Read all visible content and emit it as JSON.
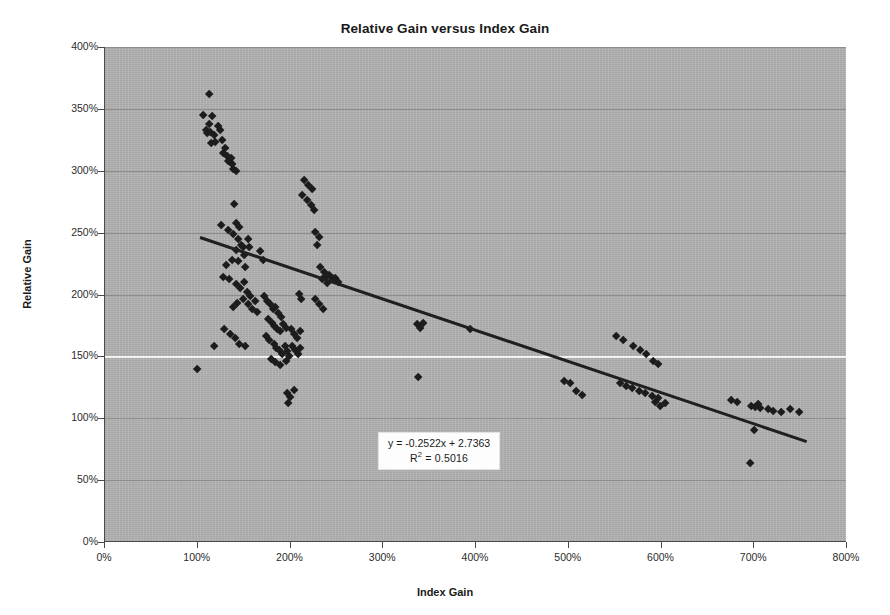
{
  "chart_data": {
    "type": "scatter",
    "title": "Relative Gain versus Index Gain",
    "xlabel": "Index Gain",
    "ylabel": "Relative Gain",
    "xlim": [
      0,
      800
    ],
    "ylim": [
      0,
      400
    ],
    "xtick_labels": [
      "0%",
      "100%",
      "200%",
      "300%",
      "400%",
      "500%",
      "600%",
      "700%",
      "800%"
    ],
    "xticks": [
      0,
      100,
      200,
      300,
      400,
      500,
      600,
      700,
      800
    ],
    "ytick_labels": [
      "0%",
      "50%",
      "100%",
      "150%",
      "200%",
      "250%",
      "300%",
      "350%",
      "400%"
    ],
    "yticks": [
      0,
      50,
      100,
      150,
      200,
      250,
      300,
      350,
      400
    ],
    "grid": "horizontal",
    "grid_highlight_value": 150,
    "legend": "none",
    "plot_background": "#b2b2b2",
    "marker": "diamond",
    "marker_color": "#1c1c1c",
    "trendline": {
      "type": "linear",
      "slope": -0.2522,
      "intercept": 2.7363,
      "r_squared": 0.5016,
      "equation_label": "y = -0.2522x + 2.7363",
      "r2_label_prefix": "R",
      "r2_label_sup": "2",
      "r2_label_suffix": " = 0.5016",
      "color": "#1f1f1f",
      "x_start": 103,
      "x_end": 757
    },
    "points": [
      [
        113,
        362
      ],
      [
        107,
        345
      ],
      [
        117,
        344
      ],
      [
        113,
        338
      ],
      [
        110,
        333
      ],
      [
        111,
        330
      ],
      [
        115,
        331
      ],
      [
        119,
        329
      ],
      [
        123,
        336
      ],
      [
        125,
        333
      ],
      [
        120,
        323
      ],
      [
        116,
        322
      ],
      [
        127,
        325
      ],
      [
        131,
        318
      ],
      [
        129,
        314
      ],
      [
        133,
        312
      ],
      [
        134,
        308
      ],
      [
        136,
        307
      ],
      [
        138,
        305
      ],
      [
        137,
        310
      ],
      [
        139,
        301
      ],
      [
        142,
        300
      ],
      [
        140,
        273
      ],
      [
        126,
        256
      ],
      [
        134,
        252
      ],
      [
        139,
        249
      ],
      [
        142,
        258
      ],
      [
        145,
        245
      ],
      [
        146,
        254
      ],
      [
        148,
        240
      ],
      [
        150,
        238
      ],
      [
        143,
        236
      ],
      [
        151,
        232
      ],
      [
        138,
        228
      ],
      [
        132,
        224
      ],
      [
        145,
        227
      ],
      [
        152,
        222
      ],
      [
        155,
        245
      ],
      [
        157,
        238
      ],
      [
        128,
        214
      ],
      [
        135,
        212
      ],
      [
        142,
        208
      ],
      [
        147,
        205
      ],
      [
        151,
        210
      ],
      [
        154,
        202
      ],
      [
        158,
        199
      ],
      [
        150,
        196
      ],
      [
        144,
        193
      ],
      [
        139,
        190
      ],
      [
        155,
        192
      ],
      [
        160,
        188
      ],
      [
        163,
        195
      ],
      [
        165,
        186
      ],
      [
        130,
        172
      ],
      [
        136,
        168
      ],
      [
        141,
        165
      ],
      [
        146,
        160
      ],
      [
        152,
        158
      ],
      [
        119,
        158
      ],
      [
        101,
        140
      ],
      [
        168,
        235
      ],
      [
        172,
        228
      ],
      [
        173,
        199
      ],
      [
        176,
        195
      ],
      [
        179,
        192
      ],
      [
        182,
        188
      ],
      [
        185,
        190
      ],
      [
        188,
        185
      ],
      [
        191,
        182
      ],
      [
        177,
        180
      ],
      [
        181,
        177
      ],
      [
        184,
        174
      ],
      [
        187,
        172
      ],
      [
        190,
        170
      ],
      [
        193,
        176
      ],
      [
        196,
        173
      ],
      [
        175,
        166
      ],
      [
        178,
        163
      ],
      [
        183,
        160
      ],
      [
        186,
        157
      ],
      [
        189,
        155
      ],
      [
        192,
        152
      ],
      [
        195,
        158
      ],
      [
        198,
        154
      ],
      [
        200,
        150
      ],
      [
        180,
        148
      ],
      [
        185,
        145
      ],
      [
        190,
        143
      ],
      [
        196,
        146
      ],
      [
        202,
        172
      ],
      [
        205,
        168
      ],
      [
        208,
        165
      ],
      [
        211,
        170
      ],
      [
        203,
        158
      ],
      [
        206,
        155
      ],
      [
        209,
        152
      ],
      [
        212,
        157
      ],
      [
        197,
        120
      ],
      [
        201,
        117
      ],
      [
        205,
        123
      ],
      [
        199,
        112
      ],
      [
        210,
        200
      ],
      [
        213,
        196
      ],
      [
        216,
        292
      ],
      [
        220,
        288
      ],
      [
        224,
        285
      ],
      [
        219,
        276
      ],
      [
        223,
        272
      ],
      [
        227,
        268
      ],
      [
        214,
        280
      ],
      [
        228,
        250
      ],
      [
        232,
        246
      ],
      [
        230,
        240
      ],
      [
        233,
        222
      ],
      [
        237,
        218
      ],
      [
        240,
        215
      ],
      [
        235,
        212
      ],
      [
        243,
        216
      ],
      [
        246,
        213
      ],
      [
        241,
        209
      ],
      [
        228,
        196
      ],
      [
        232,
        192
      ],
      [
        236,
        188
      ],
      [
        249,
        213
      ],
      [
        252,
        210
      ],
      [
        338,
        176
      ],
      [
        341,
        173
      ],
      [
        344,
        177
      ],
      [
        339,
        133
      ],
      [
        395,
        172
      ],
      [
        496,
        130
      ],
      [
        503,
        128
      ],
      [
        509,
        122
      ],
      [
        516,
        119
      ],
      [
        552,
        166
      ],
      [
        560,
        163
      ],
      [
        571,
        158
      ],
      [
        578,
        155
      ],
      [
        585,
        152
      ],
      [
        592,
        146
      ],
      [
        598,
        144
      ],
      [
        556,
        128
      ],
      [
        563,
        126
      ],
      [
        570,
        124
      ],
      [
        577,
        122
      ],
      [
        584,
        120
      ],
      [
        591,
        118
      ],
      [
        598,
        116
      ],
      [
        594,
        113
      ],
      [
        600,
        110
      ],
      [
        605,
        112
      ],
      [
        676,
        115
      ],
      [
        683,
        113
      ],
      [
        698,
        110
      ],
      [
        702,
        109
      ],
      [
        705,
        111
      ],
      [
        708,
        108
      ],
      [
        716,
        107
      ],
      [
        722,
        106
      ],
      [
        730,
        105
      ],
      [
        740,
        107
      ],
      [
        750,
        105
      ],
      [
        701,
        90
      ],
      [
        697,
        64
      ]
    ]
  },
  "equation_box": {
    "position_x": 378,
    "position_y": 432
  }
}
